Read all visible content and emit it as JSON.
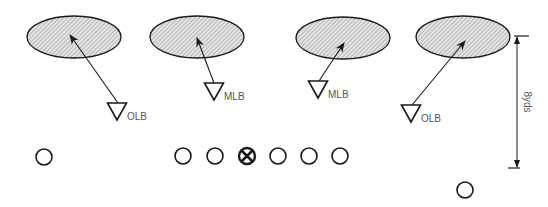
{
  "diagram": {
    "type": "football-defensive-alignment",
    "colors": {
      "stroke": "#1a1a1a",
      "zone_fill": "#d9d9d9",
      "hatch": "#8a8a8a",
      "label": "#555555",
      "background": "#ffffff"
    },
    "zones": [
      {
        "id": "zone-1",
        "cx": 74,
        "cy": 37,
        "rx": 47,
        "ry": 21
      },
      {
        "id": "zone-2",
        "cx": 197,
        "cy": 37,
        "rx": 47,
        "ry": 21
      },
      {
        "id": "zone-3",
        "cx": 343,
        "cy": 38,
        "rx": 47,
        "ry": 21
      },
      {
        "id": "zone-4",
        "cx": 463,
        "cy": 37,
        "rx": 47,
        "ry": 21
      }
    ],
    "defenders": [
      {
        "id": "olb-left",
        "label": "OLB",
        "x": 117,
        "top": 103
      },
      {
        "id": "mlb-left",
        "label": "MLB",
        "x": 214,
        "top": 83
      },
      {
        "id": "mlb-right",
        "label": "MLB",
        "x": 318,
        "top": 81
      },
      {
        "id": "olb-right",
        "label": "OLB",
        "x": 411,
        "top": 105
      }
    ],
    "drops": [
      {
        "from": [
          118,
          103
        ],
        "to": [
          70,
          35
        ]
      },
      {
        "from": [
          214,
          83
        ],
        "to": [
          197,
          38
        ]
      },
      {
        "from": [
          319,
          81
        ],
        "to": [
          344,
          43
        ]
      },
      {
        "from": [
          412,
          105
        ],
        "to": [
          465,
          41
        ]
      }
    ],
    "offense": [
      {
        "id": "split-end",
        "cx": 44,
        "cy": 157,
        "center": false
      },
      {
        "id": "left-tackle",
        "cx": 183,
        "cy": 156,
        "center": false
      },
      {
        "id": "left-guard",
        "cx": 215,
        "cy": 156,
        "center": false
      },
      {
        "id": "center",
        "cx": 247,
        "cy": 156,
        "center": true
      },
      {
        "id": "right-guard",
        "cx": 278,
        "cy": 156,
        "center": false
      },
      {
        "id": "right-tackle",
        "cx": 309,
        "cy": 156,
        "center": false
      },
      {
        "id": "tight-end",
        "cx": 340,
        "cy": 156,
        "center": false
      },
      {
        "id": "back",
        "cx": 465,
        "cy": 190,
        "center": false
      }
    ],
    "measurement": {
      "label": "8yds",
      "x": 517,
      "top": 36,
      "bottom": 168
    }
  }
}
